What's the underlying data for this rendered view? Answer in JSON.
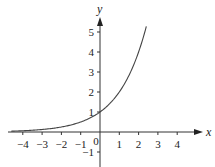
{
  "chart_data": {
    "type": "line",
    "title": "",
    "function": "y = 2^x",
    "xlabel": "x",
    "ylabel": "y",
    "xlim": [
      -4.6,
      5.2
    ],
    "ylim": [
      -1.6,
      5.9
    ],
    "grid": false,
    "x_ticks": [
      -4,
      -3,
      -2,
      -1,
      0,
      1,
      2,
      3,
      4
    ],
    "x_tick_labels": [
      "−4",
      "−3",
      "−2",
      "−1",
      "0",
      "1",
      "2",
      "3",
      "4"
    ],
    "y_ticks": [
      -1,
      1,
      2,
      3,
      4,
      5
    ],
    "y_tick_labels": [
      "−1",
      "1",
      "2",
      "3",
      "4",
      "5"
    ],
    "series": [
      {
        "name": "y = 2^x",
        "x": [
          -4.6,
          -4,
          -3,
          -2,
          -1,
          0,
          1,
          2,
          2.4
        ],
        "y": [
          0.04,
          0.0625,
          0.125,
          0.25,
          0.5,
          1,
          2,
          4,
          5.28
        ]
      }
    ],
    "colors": {
      "axis": "#333333",
      "curve": "#444444"
    }
  }
}
